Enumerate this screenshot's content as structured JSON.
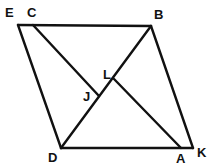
{
  "diagram": {
    "type": "geometry-figure",
    "points": [
      {
        "name": "E",
        "label": "E"
      },
      {
        "name": "C",
        "label": "C"
      },
      {
        "name": "B",
        "label": "B"
      },
      {
        "name": "D",
        "label": "D"
      },
      {
        "name": "A",
        "label": "A"
      },
      {
        "name": "K",
        "label": "K"
      },
      {
        "name": "L",
        "label": "L"
      },
      {
        "name": "J",
        "label": "J"
      }
    ],
    "segments": [
      {
        "from": "E",
        "to": "B"
      },
      {
        "from": "E",
        "to": "D"
      },
      {
        "from": "D",
        "to": "K"
      },
      {
        "from": "B",
        "to": "K"
      },
      {
        "from": "D",
        "to": "B"
      },
      {
        "from": "C",
        "to": "J"
      },
      {
        "from": "L",
        "to": "A"
      }
    ],
    "colors": {
      "stroke": "#111111",
      "background": "#ffffff"
    }
  }
}
